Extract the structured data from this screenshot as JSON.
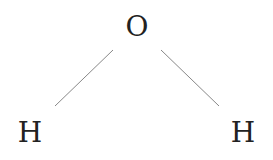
{
  "diagram": {
    "atoms": [
      {
        "id": "O",
        "label": "O",
        "x": 137,
        "y": 27
      },
      {
        "id": "H1",
        "label": "H",
        "x": 30,
        "y": 133
      },
      {
        "id": "H2",
        "label": "H",
        "x": 243,
        "y": 133
      }
    ],
    "bonds": [
      {
        "from": "O",
        "to": "H1",
        "x1": 113,
        "y1": 50,
        "x2": 55,
        "y2": 106
      },
      {
        "from": "O",
        "to": "H2",
        "x1": 161,
        "y1": 50,
        "x2": 219,
        "y2": 106
      }
    ],
    "colors": {
      "text": "#222222",
      "bond": "#888888",
      "background": "#ffffff"
    }
  }
}
